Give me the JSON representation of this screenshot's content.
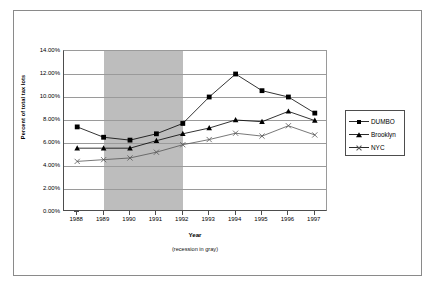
{
  "chart_data": {
    "type": "line",
    "title": "",
    "xlabel": "Year",
    "ylabel": "Percent of total tax lots",
    "note": "(recession in gray)",
    "categories": [
      "1988",
      "1989",
      "1990",
      "1991",
      "1992",
      "1993",
      "1994",
      "1995",
      "1996",
      "1997"
    ],
    "ylim": [
      0,
      14
    ],
    "ytick_labels": [
      "14.00%",
      "12.00%",
      "10.00%",
      "8.00%",
      "6.00%",
      "4.00%",
      "2.00%",
      "0.00%"
    ],
    "ytick_values": [
      14,
      12,
      10,
      8,
      6,
      4,
      2,
      0
    ],
    "grid": true,
    "legend_position": "right",
    "shaded_region": {
      "label": "recession",
      "from": "1989",
      "to": "1992",
      "color": "#bdbdbd"
    },
    "series": [
      {
        "name": "DUMBO",
        "marker": "filled-square",
        "color": "#000000",
        "values": [
          7.4,
          6.5,
          6.25,
          6.8,
          7.7,
          10.0,
          12.0,
          10.55,
          10.0,
          8.6
        ]
      },
      {
        "name": "Brooklyn",
        "marker": "filled-triangle",
        "color": "#000000",
        "values": [
          5.55,
          5.55,
          5.55,
          6.2,
          6.8,
          7.3,
          8.0,
          7.85,
          8.75,
          7.95
        ]
      },
      {
        "name": "NYC",
        "marker": "cross-x",
        "color": "#555555",
        "values": [
          4.4,
          4.55,
          4.7,
          5.2,
          5.85,
          6.3,
          6.85,
          6.6,
          7.5,
          6.7
        ]
      }
    ]
  },
  "legend": {
    "items": [
      {
        "label": "DUMBO"
      },
      {
        "label": "Brooklyn"
      },
      {
        "label": "NYC"
      }
    ]
  }
}
